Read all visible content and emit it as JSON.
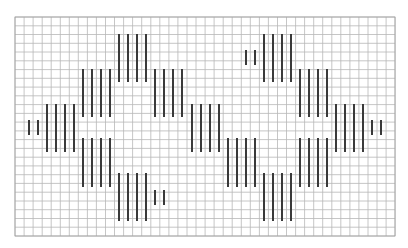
{
  "pattern": {
    "description": "Stitch grid chart with vertical bar stitches forming two diamond motifs",
    "colors": {
      "background": "#ffffff",
      "grid_line": "#b8b8b8",
      "grid_border": "#a0a0a0",
      "stitch": "#3a3a3a"
    },
    "grid": {
      "x0": 15,
      "y0": 17,
      "x1": 395,
      "y1": 236,
      "pitch_x": 9.05,
      "pitch_y": 8.76
    },
    "stitch_width": 2,
    "bars": [
      {
        "x": 29,
        "y1": 120,
        "y2": 135
      },
      {
        "x": 38,
        "y1": 120,
        "y2": 135
      },
      {
        "x": 47,
        "y1": 104,
        "y2": 152
      },
      {
        "x": 56,
        "y1": 104,
        "y2": 152
      },
      {
        "x": 65,
        "y1": 104,
        "y2": 152
      },
      {
        "x": 74,
        "y1": 104,
        "y2": 152
      },
      {
        "x": 83,
        "y1": 69,
        "y2": 117
      },
      {
        "x": 92,
        "y1": 69,
        "y2": 117
      },
      {
        "x": 101,
        "y1": 69,
        "y2": 117
      },
      {
        "x": 110,
        "y1": 69,
        "y2": 117
      },
      {
        "x": 83,
        "y1": 138,
        "y2": 187
      },
      {
        "x": 92,
        "y1": 138,
        "y2": 187
      },
      {
        "x": 101,
        "y1": 138,
        "y2": 187
      },
      {
        "x": 110,
        "y1": 138,
        "y2": 187
      },
      {
        "x": 119,
        "y1": 34,
        "y2": 82
      },
      {
        "x": 128,
        "y1": 34,
        "y2": 82
      },
      {
        "x": 137,
        "y1": 34,
        "y2": 82
      },
      {
        "x": 146,
        "y1": 34,
        "y2": 82
      },
      {
        "x": 119,
        "y1": 173,
        "y2": 221
      },
      {
        "x": 128,
        "y1": 173,
        "y2": 221
      },
      {
        "x": 137,
        "y1": 173,
        "y2": 221
      },
      {
        "x": 146,
        "y1": 173,
        "y2": 221
      },
      {
        "x": 155,
        "y1": 190,
        "y2": 205
      },
      {
        "x": 164,
        "y1": 190,
        "y2": 205
      },
      {
        "x": 155,
        "y1": 69,
        "y2": 117
      },
      {
        "x": 164,
        "y1": 69,
        "y2": 117
      },
      {
        "x": 173,
        "y1": 69,
        "y2": 117
      },
      {
        "x": 182,
        "y1": 69,
        "y2": 117
      },
      {
        "x": 192,
        "y1": 104,
        "y2": 152
      },
      {
        "x": 201,
        "y1": 104,
        "y2": 152
      },
      {
        "x": 210,
        "y1": 104,
        "y2": 152
      },
      {
        "x": 219,
        "y1": 104,
        "y2": 152
      },
      {
        "x": 228,
        "y1": 138,
        "y2": 187
      },
      {
        "x": 237,
        "y1": 138,
        "y2": 187
      },
      {
        "x": 246,
        "y1": 138,
        "y2": 187
      },
      {
        "x": 255,
        "y1": 138,
        "y2": 187
      },
      {
        "x": 246,
        "y1": 50,
        "y2": 65
      },
      {
        "x": 255,
        "y1": 50,
        "y2": 65
      },
      {
        "x": 264,
        "y1": 34,
        "y2": 82
      },
      {
        "x": 273,
        "y1": 34,
        "y2": 82
      },
      {
        "x": 282,
        "y1": 34,
        "y2": 82
      },
      {
        "x": 291,
        "y1": 34,
        "y2": 82
      },
      {
        "x": 264,
        "y1": 173,
        "y2": 221
      },
      {
        "x": 273,
        "y1": 173,
        "y2": 221
      },
      {
        "x": 282,
        "y1": 173,
        "y2": 221
      },
      {
        "x": 291,
        "y1": 173,
        "y2": 221
      },
      {
        "x": 300,
        "y1": 69,
        "y2": 117
      },
      {
        "x": 309,
        "y1": 69,
        "y2": 117
      },
      {
        "x": 318,
        "y1": 69,
        "y2": 117
      },
      {
        "x": 327,
        "y1": 69,
        "y2": 117
      },
      {
        "x": 300,
        "y1": 138,
        "y2": 187
      },
      {
        "x": 309,
        "y1": 138,
        "y2": 187
      },
      {
        "x": 318,
        "y1": 138,
        "y2": 187
      },
      {
        "x": 327,
        "y1": 138,
        "y2": 187
      },
      {
        "x": 336,
        "y1": 104,
        "y2": 152
      },
      {
        "x": 345,
        "y1": 104,
        "y2": 152
      },
      {
        "x": 354,
        "y1": 104,
        "y2": 152
      },
      {
        "x": 363,
        "y1": 104,
        "y2": 152
      },
      {
        "x": 372,
        "y1": 120,
        "y2": 135
      },
      {
        "x": 381,
        "y1": 120,
        "y2": 135
      }
    ]
  }
}
